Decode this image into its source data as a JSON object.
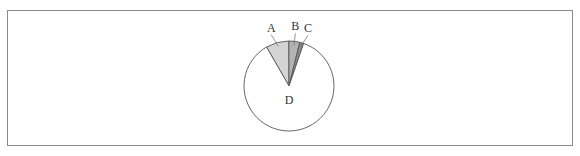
{
  "chart_data": {
    "type": "pie",
    "title": "",
    "categories": [
      "A",
      "B",
      "C",
      "D"
    ],
    "values": [
      8.3,
      3.9,
      1.4,
      86.4
    ],
    "unit": "percent (estimated from slice angles)",
    "start_angle_deg": -30,
    "direction": "clockwise",
    "colors": [
      "#d4d4d4",
      "#b3b3b3",
      "#8c8c8c",
      "#ffffff"
    ],
    "labels": [
      {
        "text": "A",
        "position": "outside, with leader line"
      },
      {
        "text": "B",
        "position": "outside, with leader line"
      },
      {
        "text": "C",
        "position": "outside, with leader line"
      },
      {
        "text": "D",
        "position": "inside"
      }
    ],
    "legend": "none"
  }
}
